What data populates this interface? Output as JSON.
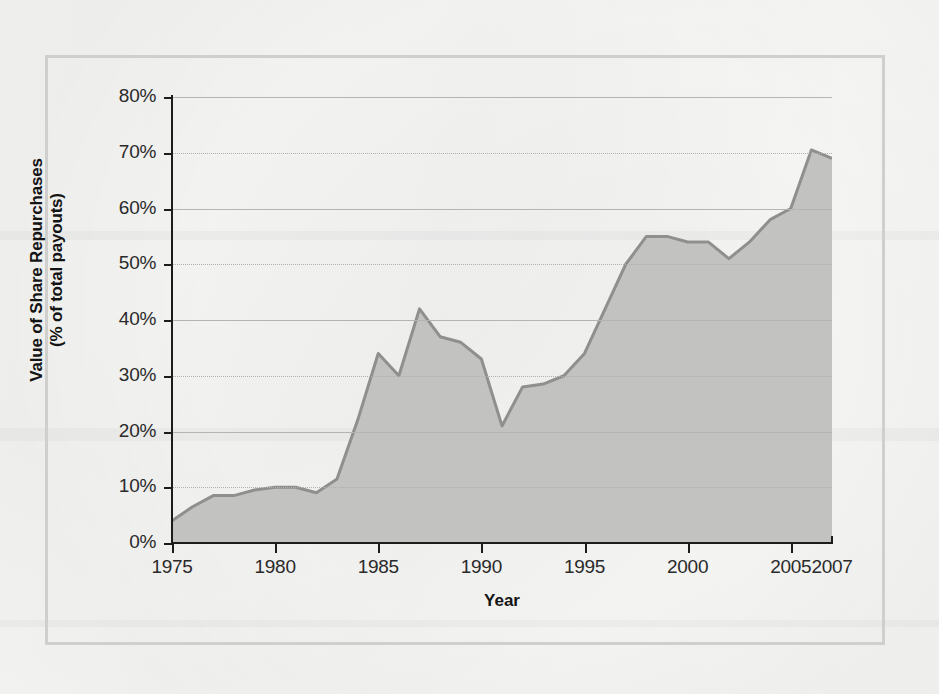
{
  "figure": {
    "frame_color": "#cfcfcd",
    "background": "#f2f2f0"
  },
  "chart_data": {
    "type": "area",
    "title": "",
    "subtitle": "",
    "xlabel": "Year",
    "ylabel": "Value of Share Repurchases\n(% of total payouts)",
    "ylabel_line1": "Value of Share Repurchases",
    "ylabel_line2": "(% of total payouts)",
    "xlim": [
      1975,
      2007
    ],
    "ylim": [
      0,
      80
    ],
    "grid": true,
    "grid_axis": "y",
    "legend": "none",
    "series_fill_color": "#c2c2c0",
    "series_line_color": "#8f8f8d",
    "x_tick_labels": [
      "1975",
      "1980",
      "1985",
      "1990",
      "1995",
      "2000",
      "2005",
      "2007"
    ],
    "x_tick_values": [
      1975,
      1980,
      1985,
      1990,
      1995,
      2000,
      2005,
      2007
    ],
    "y_tick_labels": [
      "0%",
      "10%",
      "20%",
      "30%",
      "40%",
      "50%",
      "60%",
      "70%",
      "80%"
    ],
    "y_tick_values": [
      0,
      10,
      20,
      30,
      40,
      50,
      60,
      70,
      80
    ],
    "x": [
      1975,
      1976,
      1977,
      1978,
      1979,
      1980,
      1981,
      1982,
      1983,
      1984,
      1985,
      1986,
      1987,
      1988,
      1989,
      1990,
      1991,
      1992,
      1993,
      1994,
      1995,
      1996,
      1997,
      1998,
      1999,
      2000,
      2001,
      2002,
      2003,
      2004,
      2005,
      2006,
      2007
    ],
    "values": [
      4.0,
      6.5,
      8.5,
      8.5,
      9.5,
      10.0,
      10.0,
      9.0,
      11.5,
      22.0,
      34.0,
      30.0,
      42.0,
      37.0,
      36.0,
      33.0,
      21.0,
      28.0,
      28.5,
      30.0,
      34.0,
      42.0,
      50.0,
      55.0,
      55.0,
      54.0,
      54.0,
      51.0,
      54.0,
      58.0,
      60.0,
      70.5,
      69.0
    ],
    "value_unit": "%",
    "annotations": []
  }
}
